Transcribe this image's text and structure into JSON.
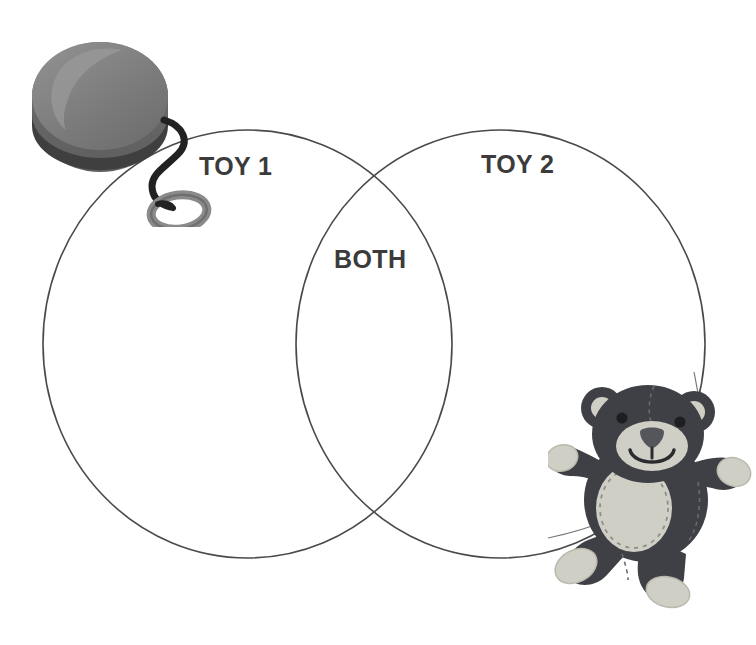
{
  "page": {
    "background_color": "#ffffff",
    "width": 756,
    "height": 645
  },
  "diagram": {
    "type": "venn-2-set",
    "outline_color": "#4a4a4a",
    "outline_width": 1.6,
    "fill": "none",
    "left_circle": {
      "cx": 247.5,
      "cy": 344,
      "rx": 204.5,
      "ry": 214
    },
    "right_circle": {
      "cx": 500.5,
      "cy": 344,
      "rx": 204.5,
      "ry": 214
    },
    "labels": {
      "left": "TOY 1",
      "right": "TOY 2",
      "overlap": "BOTH"
    },
    "label_color": "#3b3b3b"
  },
  "illustrations": {
    "yoyo": {
      "name": "yo-yo",
      "body_color": "#7d7d7d",
      "body_highlight": "#8d8d8d",
      "body_shade": "#6a6a6a",
      "rim_color": "#4b4b4b",
      "string_color": "#222222",
      "loop_color": "#8a8a8a",
      "loop_shade": "#6f6f6f"
    },
    "teddy_bear": {
      "name": "teddy-bear",
      "body_color": "#3f4045",
      "body_shade": "#34353a",
      "accent_color": "#cfcfc6",
      "accent_shade": "#b9b9ae",
      "nose_color": "#55565c",
      "eye_color": "#1d1e22",
      "stitch_color": "#6a6b70",
      "string_color": "#555555"
    }
  }
}
